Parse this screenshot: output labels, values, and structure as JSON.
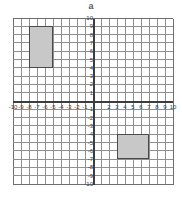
{
  "figure": {
    "label": "a"
  },
  "chart_data": {
    "type": "scatter",
    "title": "a",
    "xlabel": "",
    "ylabel": "",
    "xlim": [
      -10,
      10
    ],
    "ylim": [
      -10,
      10
    ],
    "grid": true,
    "legend": null,
    "x_ticks": [
      -10,
      -9,
      -8,
      -7,
      -6,
      -5,
      -4,
      -3,
      -2,
      -1,
      1,
      2,
      3,
      4,
      5,
      6,
      7,
      8,
      9,
      10
    ],
    "x_tick_labels": [
      "-10",
      "-9",
      "-8",
      "-7",
      "-6",
      "-5",
      "-4",
      "-3",
      "-2",
      "-1",
      "",
      "2",
      "3",
      "4",
      "5",
      "6",
      "7",
      "8",
      "9",
      "10"
    ],
    "y_ticks": [
      10,
      9,
      8,
      7,
      6,
      5,
      4,
      3,
      2,
      1,
      -1,
      -2,
      -3,
      -4,
      -5,
      -6,
      -7,
      -8,
      -9,
      -10
    ],
    "y_tick_labels": [
      "10",
      "9",
      "8",
      "7",
      "6",
      "5",
      "4",
      "3",
      "2",
      "1",
      "-1",
      "-2",
      "-3",
      "-4",
      "-5",
      "-6",
      "-7",
      "-8",
      "-9",
      "-10"
    ],
    "shapes": [
      {
        "name": "upper-left-rectangle",
        "kind": "rectangle",
        "x_min": -8,
        "x_max": -5,
        "y_min": 4,
        "y_max": 9,
        "width_units": 3,
        "height_units": 5,
        "fill": "#c8c8c8",
        "stroke": "#4a4a4a"
      },
      {
        "name": "lower-right-rectangle",
        "kind": "rectangle",
        "x_min": 3,
        "x_max": 7,
        "y_min": -7,
        "y_max": -4,
        "width_units": 4,
        "height_units": 3,
        "fill": "#c8c8c8",
        "stroke": "#4a4a4a"
      }
    ],
    "colors": {
      "grid_line": "#8f8f8f",
      "axis_line": "#3d3d3d",
      "shape_fill": "#c8c8c8",
      "shape_stroke": "#4a4a4a",
      "background": "#ffffff",
      "tick_text": "#3a3a3a"
    }
  }
}
